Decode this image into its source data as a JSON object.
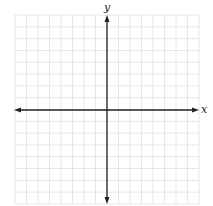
{
  "diagram": {
    "type": "cartesian-coordinate-grid",
    "x_axis_label": "x",
    "y_axis_label": "y",
    "grid": {
      "columns": 16,
      "rows": 16,
      "visible": true,
      "color": "#e6e6e6"
    },
    "axis_color": "#222222",
    "axes_have_arrows": true
  }
}
